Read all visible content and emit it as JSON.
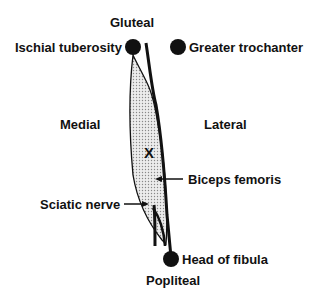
{
  "labels": {
    "gluteal": "Gluteal",
    "ischial_tuberosity": "Ischial tuberosity",
    "greater_trochanter": "Greater trochanter",
    "medial": "Medial",
    "lateral": "Lateral",
    "x_mark": "X",
    "biceps_femoris": "Biceps femoris",
    "sciatic_nerve": "Sciatic nerve",
    "head_of_fibula": "Head of fibula",
    "popliteal": "Popliteal"
  },
  "colors": {
    "ink": "#111111",
    "fill_stipple": "#d8d8d8",
    "background": "#ffffff"
  }
}
